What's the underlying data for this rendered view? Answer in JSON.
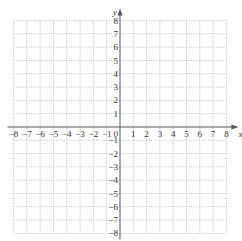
{
  "chart_data": {
    "type": "coordinate-grid",
    "title": "",
    "xlabel": "x",
    "ylabel": "y",
    "xlim": [
      -8,
      8
    ],
    "ylim": [
      -8,
      8
    ],
    "x_ticks": [
      -8,
      -7,
      -6,
      -5,
      -4,
      -3,
      -2,
      -1,
      1,
      2,
      3,
      4,
      5,
      6,
      7,
      8
    ],
    "y_ticks": [
      -8,
      -7,
      -6,
      -5,
      -4,
      -3,
      -2,
      -1,
      1,
      2,
      3,
      4,
      5,
      6,
      7,
      8
    ],
    "origin_label": "0",
    "grid": true,
    "grid_style": "dotted",
    "series": []
  },
  "colors": {
    "grid": "#9a9a9a",
    "axis": "#555555",
    "text": "#333333"
  },
  "layout": {
    "origin_px": [
      120,
      127
    ],
    "unit_px": 13.3
  }
}
